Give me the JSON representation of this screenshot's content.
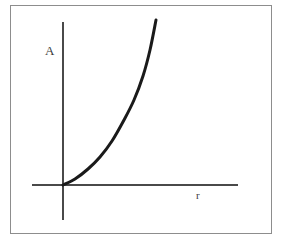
{
  "figure": {
    "background_color": "#ffffff",
    "frame": {
      "name": "figure-border",
      "color": "#8d8d8d",
      "x": 10,
      "y": 5,
      "width": 262,
      "height": 229
    }
  },
  "axes": {
    "y": {
      "label": "A",
      "color": "#4a4a4a",
      "x": 63,
      "y_top": 22,
      "y_bottom": 220
    },
    "x": {
      "label": "r",
      "color": "#4a4a4a",
      "y": 185,
      "x_left": 32,
      "x_right": 238
    },
    "origin": {
      "x": 63,
      "y": 185
    }
  },
  "chart_data": {
    "type": "line",
    "title": "",
    "subtitle": "",
    "xlabel": "r",
    "ylabel": "A",
    "grid": false,
    "legend": null,
    "axis_ticks": {
      "x": [],
      "y": []
    },
    "annotations": [],
    "series": [
      {
        "name": "A(r)",
        "color": "#1a1a1a",
        "line_width": 3,
        "description": "Monotonically increasing convex (exponential-like) curve rising from the origin",
        "points_px": [
          {
            "x": 63,
            "y": 185
          },
          {
            "x": 75,
            "y": 179
          },
          {
            "x": 88,
            "y": 169
          },
          {
            "x": 100,
            "y": 157
          },
          {
            "x": 112,
            "y": 141
          },
          {
            "x": 124,
            "y": 120
          },
          {
            "x": 134,
            "y": 100
          },
          {
            "x": 143,
            "y": 76
          },
          {
            "x": 150,
            "y": 50
          },
          {
            "x": 156,
            "y": 20
          }
        ],
        "x": [
          0.0,
          0.1,
          0.2,
          0.3,
          0.4,
          0.5,
          0.6,
          0.7,
          0.8,
          0.9
        ],
        "values": [
          0.0,
          0.04,
          0.1,
          0.17,
          0.27,
          0.39,
          0.51,
          0.65,
          0.81,
          1.0
        ]
      }
    ],
    "xlim": [
      0,
      1
    ],
    "ylim": [
      0,
      1
    ]
  }
}
